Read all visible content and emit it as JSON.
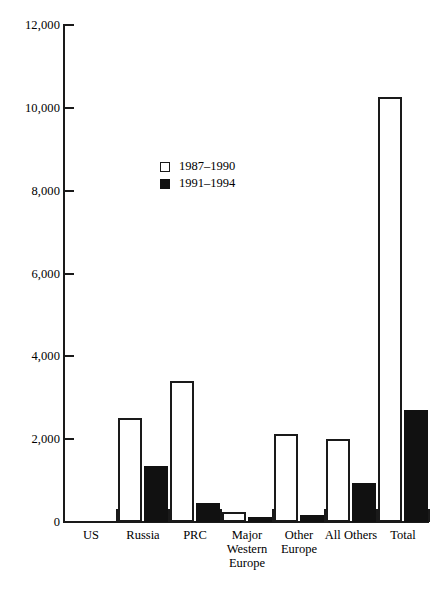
{
  "chart_data": {
    "type": "bar",
    "title": "",
    "subtitle": "",
    "xlabel": "",
    "ylabel": "",
    "grid": false,
    "legend_position": "inside-upper-left",
    "categories": [
      "US",
      "Russia",
      "PRC",
      "Major\nWestern\nEurope",
      "Other\nEurope",
      "All Others",
      "Total"
    ],
    "series": [
      {
        "name": "1987–1990",
        "style": "open",
        "color": "#ffffff",
        "edge_color": "#1a1a1a",
        "values": [
          0,
          2500,
          3400,
          250,
          2120,
          2000,
          10250
        ]
      },
      {
        "name": "1991–1994",
        "style": "filled",
        "color": "#111111",
        "edge_color": "#111111",
        "values": [
          0,
          1350,
          460,
          130,
          160,
          930,
          2700
        ]
      }
    ],
    "ylim": [
      0,
      12000
    ],
    "yticks": [
      0,
      2000,
      4000,
      6000,
      8000,
      10000,
      12000
    ],
    "ytick_labels": [
      "0",
      "2,000",
      "4,000",
      "6,000",
      "8,000",
      "10,000",
      "12,000"
    ]
  },
  "legend": {
    "entries": [
      {
        "label": "1987–1990",
        "style": "open"
      },
      {
        "label": "1991–1994",
        "style": "filled"
      }
    ]
  }
}
